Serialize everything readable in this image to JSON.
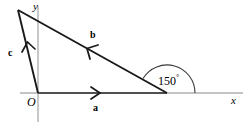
{
  "figure": {
    "type": "vector-triangle-diagram",
    "background": "#ffffff",
    "axis_color": "#8a8a8a",
    "line_color": "#1a1a1a",
    "width": 251,
    "height": 127
  },
  "axes": {
    "x_label": "x",
    "y_label": "y",
    "origin_label": "O",
    "origin_point": [
      38,
      93
    ],
    "x_axis": [
      20,
      93,
      243,
      93
    ],
    "y_axis": [
      38,
      6,
      38,
      122
    ]
  },
  "vectors": [
    {
      "name": "a",
      "label": "a",
      "from": [
        38,
        93
      ],
      "to": [
        167,
        93
      ],
      "arrow_at": [
        97,
        93
      ],
      "arrow_direction": "right",
      "label_pos": [
        95,
        104
      ]
    },
    {
      "name": "b",
      "label": "b",
      "from": [
        167,
        93
      ],
      "to": [
        18,
        10
      ],
      "arrow_at": [
        94,
        52
      ],
      "arrow_direction": "up-left",
      "label_pos": [
        92,
        33
      ]
    },
    {
      "name": "c",
      "label": "c",
      "from": [
        38,
        93
      ],
      "to": [
        18,
        10
      ],
      "arrow_at": [
        29,
        48
      ],
      "arrow_direction": "up",
      "label_pos": [
        10,
        51
      ]
    }
  ],
  "angle": {
    "label": "150",
    "degree_symbol": "°",
    "value": 150,
    "unit": "degrees",
    "vertex": [
      167,
      93
    ],
    "arc_radius": 28,
    "label_pos": [
      161,
      75
    ],
    "between": [
      "a",
      "b"
    ]
  }
}
